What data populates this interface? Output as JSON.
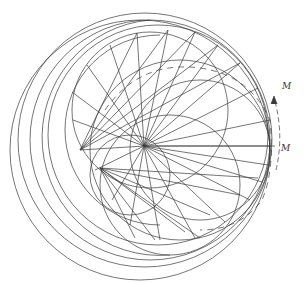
{
  "diagram": {
    "type": "geometric-construction",
    "stroke_color": "#3a3a3a",
    "background": "#ffffff",
    "hub": {
      "x": 144,
      "y": 146
    },
    "labels": [
      {
        "id": "label-m-upper",
        "text": "M",
        "x": 282,
        "y": 89
      },
      {
        "id": "label-m-lower",
        "text": "M",
        "x": 281,
        "y": 151
      }
    ],
    "arrow": {
      "direction": "counterclockwise",
      "from_label": "M (lower)",
      "to_label": "M (upper)"
    }
  }
}
